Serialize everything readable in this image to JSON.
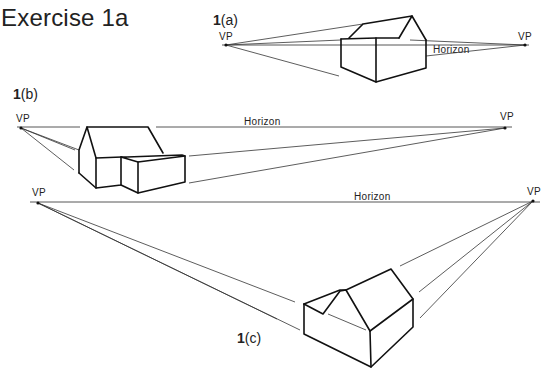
{
  "page": {
    "title": "Exercise 1a"
  },
  "figures": [
    {
      "id": "1a",
      "number": "1",
      "letter": "(a)",
      "vp_left_label": "VP",
      "vp_right_label": "VP",
      "horizon_label": "Horizon"
    },
    {
      "id": "1b",
      "number": "1",
      "letter": "(b)",
      "vp_left_label": "VP",
      "vp_right_label": "VP",
      "horizon_label": "Horizon"
    },
    {
      "id": "1c",
      "number": "1",
      "letter": "(c)",
      "vp_left_label": "VP",
      "vp_right_label": "VP",
      "horizon_label": "Horizon"
    }
  ]
}
